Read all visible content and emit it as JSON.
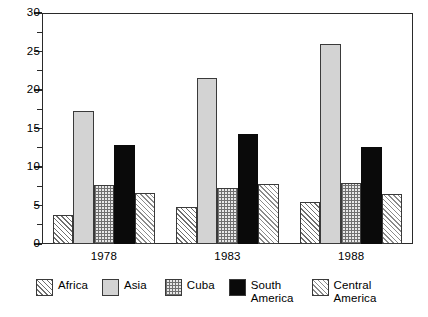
{
  "chart_data": {
    "type": "bar",
    "title": "",
    "subtitle": "",
    "xlabel": "",
    "ylabel": "",
    "categories": [
      "1978",
      "1983",
      "1988"
    ],
    "series": [
      {
        "name": "Africa",
        "values": [
          3.8,
          4.8,
          5.4
        ],
        "pattern": "diagonal-hatch",
        "color": "#ffffff"
      },
      {
        "name": "Asia",
        "values": [
          17.3,
          21.5,
          26.0
        ],
        "pattern": "solid-light-gray",
        "color": "#d3d3d3"
      },
      {
        "name": "Cuba",
        "values": [
          7.6,
          7.3,
          7.9
        ],
        "pattern": "dotted-grid",
        "color": "#e8e8e8"
      },
      {
        "name": "South\nAmerica",
        "values": [
          12.8,
          14.3,
          12.6
        ],
        "pattern": "solid-black",
        "color": "#0a0a0a"
      },
      {
        "name": "Central\nAmerica",
        "values": [
          6.6,
          7.8,
          6.5
        ],
        "pattern": "diagonal-hatch-light",
        "color": "#ffffff"
      }
    ],
    "ylim": [
      0,
      30
    ],
    "ytick_labels": [
      "0",
      "5",
      "10",
      "15",
      "20",
      "25",
      "30"
    ],
    "ytick_values": [
      0,
      5,
      10,
      15,
      20,
      25,
      30
    ],
    "yminor_values": [
      2.5,
      7.5,
      12.5,
      17.5,
      22.5,
      27.5
    ],
    "xtick_labels": [
      "1978",
      "1983",
      "1988"
    ],
    "grid": false,
    "legend_position": "bottom",
    "legend_entries": [
      "Africa",
      "Asia",
      "Cuba",
      "South\nAmerica",
      "Central\nAmerica"
    ],
    "annotations": []
  },
  "axes": {
    "y_labels": [
      "30",
      "25",
      "20",
      "15",
      "10",
      "5",
      "0"
    ],
    "x_labels": [
      "1978",
      "1983",
      "1988"
    ]
  },
  "legend": {
    "items": [
      {
        "label": "Africa"
      },
      {
        "label": "Asia"
      },
      {
        "label": "Cuba"
      },
      {
        "label": "South\nAmerica"
      },
      {
        "label": "Central\nAmerica"
      }
    ]
  }
}
